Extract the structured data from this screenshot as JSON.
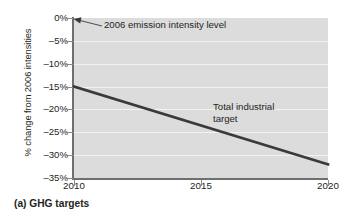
{
  "caption": "(a) GHG targets",
  "chart_data": {
    "type": "line",
    "title": "",
    "xlabel": "",
    "ylabel": "% change from 2006 intensities",
    "xlim": [
      2010,
      2020
    ],
    "ylim": [
      -35,
      0
    ],
    "grid": true,
    "legend_position": "none",
    "x_ticks": [
      "2010",
      "2015",
      "2020"
    ],
    "x_tick_values": [
      2010,
      2015,
      2020
    ],
    "y_ticks": [
      "0%",
      "–5%",
      "–10%",
      "–15%",
      "–20%",
      "–25%",
      "–30%",
      "–35%"
    ],
    "y_tick_values": [
      0,
      -5,
      -10,
      -15,
      -20,
      -25,
      -30,
      -35
    ],
    "series": [
      {
        "name": "Total industrial target",
        "color": "#3a3a3a",
        "x": [
          2010,
          2020
        ],
        "values": [
          -15,
          -32
        ]
      }
    ],
    "annotations": [
      {
        "name": "baseline-annotation",
        "text": "2006 emission intensity level",
        "points_to": {
          "x": 2010,
          "y": 0
        }
      },
      {
        "name": "series-annotation",
        "text": "Total industrial\ntarget"
      }
    ],
    "colors": {
      "plot_background": "#dcdcdc",
      "gridline": "#f2f2f2",
      "axis": "#6f6f6f",
      "line": "#3a3a3a",
      "text": "#231f20"
    }
  }
}
